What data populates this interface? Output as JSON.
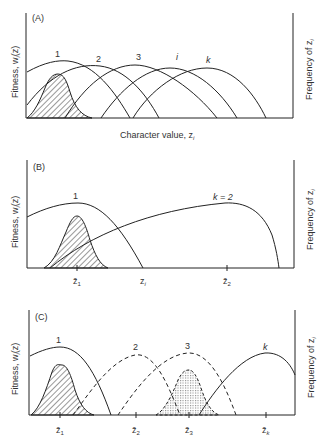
{
  "panels": {
    "a": {
      "label": "(A)",
      "y_axis_left": "Fitness, w",
      "y_axis_left_sub": "i",
      "y_axis_left_tail": "(z)",
      "y_axis_right": "Frequency of z",
      "y_axis_right_sub": "i",
      "x_axis": "Character value, z",
      "x_axis_sub": "i",
      "curve_labels": [
        "1",
        "2",
        "3",
        "i",
        "k"
      ]
    },
    "b": {
      "label": "(B)",
      "y_axis_left": "Fitness, w",
      "y_axis_left_sub": "i",
      "y_axis_left_tail": "(z)",
      "y_axis_right": "Frequency of z",
      "y_axis_right_sub": "i",
      "curve_labels": [
        "1",
        "k = 2"
      ],
      "ticks": [
        {
          "label": "z̄",
          "sub": "1"
        },
        {
          "label": "z",
          "sub": "i"
        },
        {
          "label": "z̄",
          "sub": "2"
        }
      ]
    },
    "c": {
      "label": "(C)",
      "y_axis_left": "Fitness, w",
      "y_axis_left_sub": "i",
      "y_axis_left_tail": "(z)",
      "y_axis_right": "Frequency of z",
      "y_axis_right_sub": "i",
      "curve_labels": [
        "1",
        "2",
        "3",
        "k"
      ],
      "ticks": [
        {
          "label": "z̄",
          "sub": "1"
        },
        {
          "label": "z̄",
          "sub": "2"
        },
        {
          "label": "z̄",
          "sub": "3"
        },
        {
          "label": "z̄",
          "sub": "k"
        }
      ]
    }
  },
  "colors": {
    "line": "#222222",
    "hatch": "#333333",
    "stipple": "#9a9a9a",
    "background": "#ffffff"
  }
}
